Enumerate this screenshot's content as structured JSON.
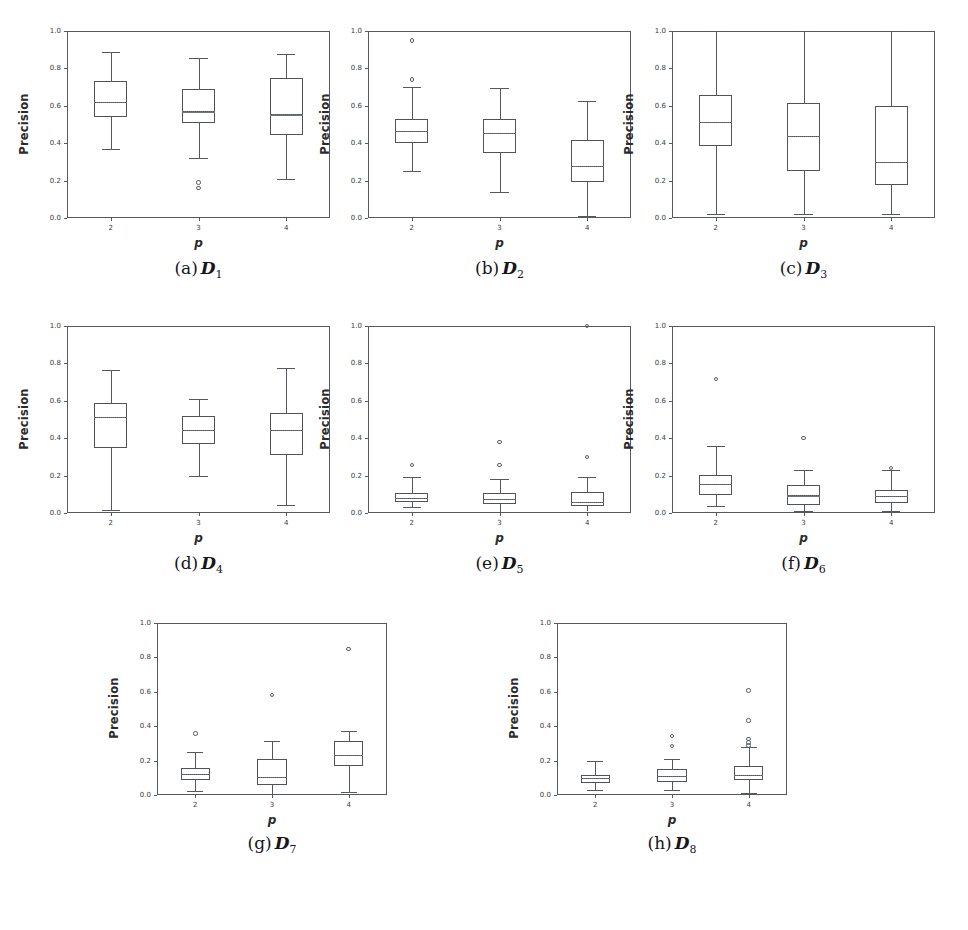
{
  "figure": {
    "ylabel": "Precision",
    "xlabel": "p",
    "y_ticks": [
      "0.0",
      "0.2",
      "0.4",
      "0.6",
      "0.8",
      "1.0"
    ],
    "x_ticks": [
      "2",
      "3",
      "4"
    ],
    "ylim": [
      0.0,
      1.0
    ],
    "panel_count": 8
  },
  "chart_data": [
    {
      "type": "box",
      "panel": "a",
      "caption_prefix": "(a)",
      "caption_symbol": "D",
      "caption_subscript": "1",
      "title": "D1",
      "xlabel": "p",
      "ylabel": "Precision",
      "ylim": [
        0.0,
        1.0
      ],
      "grid": false,
      "categories": [
        "2",
        "3",
        "4"
      ],
      "boxes": [
        {
          "x": "2",
          "whisker_low": 0.37,
          "q1": 0.54,
          "median": 0.62,
          "mean": 0.62,
          "q3": 0.73,
          "whisker_high": 0.89,
          "outliers": []
        },
        {
          "x": "3",
          "whisker_low": 0.32,
          "q1": 0.51,
          "median": 0.57,
          "mean": 0.57,
          "q3": 0.69,
          "whisker_high": 0.855,
          "outliers": [
            0.19,
            0.16
          ]
        },
        {
          "x": "4",
          "whisker_low": 0.21,
          "q1": 0.445,
          "median": 0.555,
          "mean": 0.555,
          "q3": 0.75,
          "whisker_high": 0.875,
          "outliers": []
        }
      ]
    },
    {
      "type": "box",
      "panel": "b",
      "caption_prefix": "(b)",
      "caption_symbol": "D",
      "caption_subscript": "2",
      "title": "D2",
      "xlabel": "p",
      "ylabel": "Precision",
      "ylim": [
        0.0,
        1.0
      ],
      "grid": false,
      "categories": [
        "2",
        "3",
        "4"
      ],
      "boxes": [
        {
          "x": "2",
          "whisker_low": 0.25,
          "q1": 0.4,
          "median": 0.465,
          "mean": 0.465,
          "q3": 0.53,
          "whisker_high": 0.7,
          "outliers": [
            0.95,
            0.74
          ]
        },
        {
          "x": "3",
          "whisker_low": 0.14,
          "q1": 0.35,
          "median": 0.455,
          "mean": 0.455,
          "q3": 0.53,
          "whisker_high": 0.695,
          "outliers": []
        },
        {
          "x": "4",
          "whisker_low": 0.012,
          "q1": 0.19,
          "median": 0.28,
          "mean": 0.28,
          "q3": 0.415,
          "whisker_high": 0.625,
          "outliers": []
        }
      ]
    },
    {
      "type": "box",
      "panel": "c",
      "caption_prefix": "(c)",
      "caption_symbol": "D",
      "caption_subscript": "3",
      "title": "D3",
      "xlabel": "p",
      "ylabel": "Precision",
      "ylim": [
        0.0,
        1.0
      ],
      "grid": false,
      "categories": [
        "2",
        "3",
        "4"
      ],
      "boxes": [
        {
          "x": "2",
          "whisker_low": 0.022,
          "q1": 0.385,
          "median": 0.515,
          "mean": 0.515,
          "q3": 0.66,
          "whisker_high": 1.0,
          "outliers": []
        },
        {
          "x": "3",
          "whisker_low": 0.022,
          "q1": 0.25,
          "median": 0.44,
          "mean": 0.44,
          "q3": 0.615,
          "whisker_high": 1.0,
          "outliers": []
        },
        {
          "x": "4",
          "whisker_low": 0.022,
          "q1": 0.175,
          "median": 0.3,
          "mean": 0.3,
          "q3": 0.6,
          "whisker_high": 1.0,
          "outliers": []
        }
      ]
    },
    {
      "type": "box",
      "panel": "d",
      "caption_prefix": "(d)",
      "caption_symbol": "D",
      "caption_subscript": "4",
      "title": "D4",
      "xlabel": "p",
      "ylabel": "Precision",
      "ylim": [
        0.0,
        1.0
      ],
      "grid": false,
      "categories": [
        "2",
        "3",
        "4"
      ],
      "boxes": [
        {
          "x": "2",
          "whisker_low": 0.018,
          "q1": 0.345,
          "median": 0.515,
          "mean": 0.515,
          "q3": 0.59,
          "whisker_high": 0.765,
          "outliers": []
        },
        {
          "x": "3",
          "whisker_low": 0.2,
          "q1": 0.37,
          "median": 0.445,
          "mean": 0.445,
          "q3": 0.52,
          "whisker_high": 0.61,
          "outliers": []
        },
        {
          "x": "4",
          "whisker_low": 0.045,
          "q1": 0.31,
          "median": 0.445,
          "mean": 0.445,
          "q3": 0.535,
          "whisker_high": 0.775,
          "outliers": []
        }
      ]
    },
    {
      "type": "box",
      "panel": "e",
      "caption_prefix": "(e)",
      "caption_symbol": "D",
      "caption_subscript": "5",
      "title": "D5",
      "xlabel": "p",
      "ylabel": "Precision",
      "ylim": [
        0.0,
        1.0
      ],
      "grid": false,
      "categories": [
        "2",
        "3",
        "4"
      ],
      "boxes": [
        {
          "x": "2",
          "whisker_low": 0.03,
          "q1": 0.058,
          "median": 0.082,
          "mean": 0.082,
          "q3": 0.105,
          "whisker_high": 0.19,
          "outliers": [
            0.258
          ]
        },
        {
          "x": "3",
          "whisker_low": 0.005,
          "q1": 0.05,
          "median": 0.075,
          "mean": 0.075,
          "q3": 0.105,
          "whisker_high": 0.18,
          "outliers": [
            0.38,
            0.258
          ]
        },
        {
          "x": "4",
          "whisker_low": 0.008,
          "q1": 0.04,
          "median": 0.058,
          "mean": 0.058,
          "q3": 0.112,
          "whisker_high": 0.195,
          "outliers": [
            0.298,
            1.0
          ]
        }
      ]
    },
    {
      "type": "box",
      "panel": "f",
      "caption_prefix": "(f)",
      "caption_symbol": "D",
      "caption_subscript": "6",
      "title": "D6",
      "xlabel": "p",
      "ylabel": "Precision",
      "ylim": [
        0.0,
        1.0
      ],
      "grid": false,
      "categories": [
        "2",
        "3",
        "4"
      ],
      "boxes": [
        {
          "x": "2",
          "whisker_low": 0.04,
          "q1": 0.095,
          "median": 0.155,
          "mean": 0.155,
          "q3": 0.202,
          "whisker_high": 0.36,
          "outliers": [
            0.718
          ]
        },
        {
          "x": "3",
          "whisker_low": 0.012,
          "q1": 0.042,
          "median": 0.095,
          "mean": 0.095,
          "q3": 0.152,
          "whisker_high": 0.228,
          "outliers": [
            0.4
          ]
        },
        {
          "x": "4",
          "whisker_low": 0.012,
          "q1": 0.055,
          "median": 0.092,
          "mean": 0.092,
          "q3": 0.122,
          "whisker_high": 0.228,
          "outliers": [
            0.242
          ]
        }
      ]
    },
    {
      "type": "box",
      "panel": "g",
      "caption_prefix": "(g)",
      "caption_symbol": "D",
      "caption_subscript": "7",
      "title": "D7",
      "xlabel": "p",
      "ylabel": "Precision",
      "ylim": [
        0.0,
        1.0
      ],
      "grid": false,
      "categories": [
        "2",
        "3",
        "4"
      ],
      "boxes": [
        {
          "x": "2",
          "whisker_low": 0.022,
          "q1": 0.088,
          "median": 0.122,
          "mean": 0.122,
          "q3": 0.155,
          "whisker_high": 0.25,
          "outliers": [
            0.358
          ]
        },
        {
          "x": "3",
          "whisker_low": 0.005,
          "q1": 0.058,
          "median": 0.105,
          "mean": 0.105,
          "q3": 0.212,
          "whisker_high": 0.312,
          "outliers": [
            0.582
          ]
        },
        {
          "x": "4",
          "whisker_low": 0.018,
          "q1": 0.17,
          "median": 0.232,
          "mean": 0.232,
          "q3": 0.315,
          "whisker_high": 0.372,
          "outliers": [
            0.848
          ]
        }
      ]
    },
    {
      "type": "box",
      "panel": "h",
      "caption_prefix": "(h)",
      "caption_symbol": "D",
      "caption_subscript": "8",
      "title": "D8",
      "xlabel": "p",
      "ylabel": "Precision",
      "ylim": [
        0.0,
        1.0
      ],
      "grid": false,
      "categories": [
        "2",
        "3",
        "4"
      ],
      "boxes": [
        {
          "x": "2",
          "whisker_low": 0.028,
          "q1": 0.072,
          "median": 0.098,
          "mean": 0.098,
          "q3": 0.118,
          "whisker_high": 0.2,
          "outliers": []
        },
        {
          "x": "3",
          "whisker_low": 0.028,
          "q1": 0.078,
          "median": 0.112,
          "mean": 0.112,
          "q3": 0.152,
          "whisker_high": 0.208,
          "outliers": [
            0.342,
            0.285
          ]
        },
        {
          "x": "4",
          "whisker_low": 0.012,
          "q1": 0.088,
          "median": 0.118,
          "mean": 0.118,
          "q3": 0.168,
          "whisker_high": 0.278,
          "outliers": [
            0.608,
            0.432,
            0.325,
            0.305,
            0.288
          ]
        }
      ]
    }
  ],
  "layout": {
    "panels": [
      {
        "key": "a",
        "plot_left": 67,
        "plot_top": 31,
        "plot_w": 263,
        "plot_h": 187,
        "caption_left": 67,
        "caption_top": 258
      },
      {
        "key": "b",
        "plot_left": 368,
        "plot_top": 31,
        "plot_w": 263,
        "plot_h": 187,
        "caption_left": 368,
        "caption_top": 258
      },
      {
        "key": "c",
        "plot_left": 672,
        "plot_top": 31,
        "plot_w": 263,
        "plot_h": 187,
        "caption_left": 672,
        "caption_top": 258
      },
      {
        "key": "d",
        "plot_left": 67,
        "plot_top": 326,
        "plot_w": 263,
        "plot_h": 187,
        "caption_left": 67,
        "caption_top": 553
      },
      {
        "key": "e",
        "plot_left": 368,
        "plot_top": 326,
        "plot_w": 263,
        "plot_h": 187,
        "caption_left": 368,
        "caption_top": 553
      },
      {
        "key": "f",
        "plot_left": 672,
        "plot_top": 326,
        "plot_w": 263,
        "plot_h": 187,
        "caption_left": 672,
        "caption_top": 553
      },
      {
        "key": "g",
        "plot_left": 157,
        "plot_top": 623,
        "plot_w": 230,
        "plot_h": 172,
        "caption_left": 157,
        "caption_top": 833
      },
      {
        "key": "h",
        "plot_left": 557,
        "plot_top": 623,
        "plot_w": 230,
        "plot_h": 172,
        "caption_left": 557,
        "caption_top": 833
      }
    ]
  }
}
